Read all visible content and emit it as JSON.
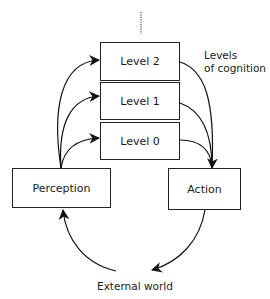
{
  "diagram": {
    "levels": [
      {
        "id": "level-2",
        "label": "Level 2"
      },
      {
        "id": "level-1",
        "label": "Level 1"
      },
      {
        "id": "level-0",
        "label": "Level 0"
      }
    ],
    "perception": {
      "label": "Perception"
    },
    "action": {
      "label": "Action"
    },
    "levels_caption": {
      "line1": "Levels",
      "line2": "of cognition"
    },
    "external_world": {
      "label": "External world"
    },
    "edges": [
      {
        "from": "Perception",
        "to": "Level 2"
      },
      {
        "from": "Perception",
        "to": "Level 1"
      },
      {
        "from": "Perception",
        "to": "Level 0"
      },
      {
        "from": "Level 2",
        "to": "Action"
      },
      {
        "from": "Level 1",
        "to": "Action"
      },
      {
        "from": "Level 0",
        "to": "Action"
      },
      {
        "from": "Action",
        "to": "External world"
      },
      {
        "from": "External world",
        "to": "Perception"
      }
    ],
    "continuation": "dotted-line-above-level-2"
  }
}
